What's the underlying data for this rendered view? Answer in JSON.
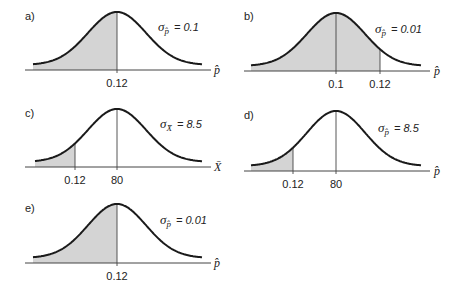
{
  "chart_data": [
    {
      "type": "area",
      "panel": "a)",
      "sigma_symbol": "σ",
      "sigma_subscript": "p̂",
      "sigma_value": "= 0.1",
      "axis_variable": "p̂",
      "mean": 0.12,
      "shade": "left",
      "cutoff": 0.12,
      "tick_labels": [
        "0.12"
      ],
      "layout": {
        "ox": 0,
        "oy": 0,
        "center": 117,
        "cutoff_x": 117,
        "axis_y": 70,
        "peak_y": 12,
        "left": 33,
        "right": 202,
        "axis_left": 25,
        "axis_right": 211,
        "width_sd": 29,
        "sig_x": 158,
        "sig_y": 31,
        "var_x": 214,
        "lab_x": 25,
        "lab_y": 20
      }
    },
    {
      "type": "area",
      "panel": "b)",
      "sigma_symbol": "σ",
      "sigma_subscript": "p̂",
      "sigma_value": "= 0.01",
      "axis_variable": "p̂",
      "mean": 0.1,
      "shade": "left",
      "cutoff": 0.12,
      "tick_labels": [
        "0.1",
        "0.12"
      ],
      "layout": {
        "ox": 0,
        "oy": 0,
        "center": 336,
        "cutoff_x": 380,
        "axis_y": 71,
        "peak_y": 13,
        "left": 251,
        "right": 421,
        "axis_left": 244,
        "axis_right": 430,
        "width_sd": 29,
        "sig_x": 375,
        "sig_y": 33,
        "var_x": 434,
        "lab_x": 244,
        "lab_y": 20
      }
    },
    {
      "type": "area",
      "panel": "c)",
      "sigma_symbol": "σ",
      "sigma_subscript": "X̄",
      "sigma_value": "= 8.5",
      "axis_variable": "X̄",
      "mean": 80,
      "shade": "left",
      "cutoff": 0.12,
      "tick_labels": [
        "0.12",
        "80"
      ],
      "layout": {
        "ox": 0,
        "oy": 0,
        "center": 117,
        "cutoff_x": 75,
        "axis_y": 167,
        "peak_y": 109,
        "left": 35,
        "right": 202,
        "axis_left": 25,
        "axis_right": 211,
        "width_sd": 29,
        "sig_x": 160,
        "sig_y": 128,
        "var_x": 214,
        "lab_x": 25,
        "lab_y": 117
      }
    },
    {
      "type": "area",
      "panel": "d)",
      "sigma_symbol": "σ",
      "sigma_subscript": "p̂",
      "sigma_value": "= 8.5",
      "axis_variable": "p̂",
      "mean": 80,
      "shade": "left",
      "cutoff": 0.12,
      "tick_labels": [
        "0.12",
        "80"
      ],
      "layout": {
        "ox": 0,
        "oy": 0,
        "center": 336,
        "cutoff_x": 293,
        "axis_y": 171,
        "peak_y": 111,
        "left": 251,
        "right": 421,
        "axis_left": 244,
        "axis_right": 430,
        "width_sd": 29,
        "sig_x": 378,
        "sig_y": 132,
        "var_x": 434,
        "lab_x": 244,
        "lab_y": 119
      }
    },
    {
      "type": "area",
      "panel": "e)",
      "sigma_symbol": "σ",
      "sigma_subscript": "p̂",
      "sigma_value": "= 0.01",
      "axis_variable": "p̂",
      "mean": 0.12,
      "shade": "left",
      "cutoff": 0.12,
      "tick_labels": [
        "0.12"
      ],
      "layout": {
        "ox": 0,
        "oy": 0,
        "center": 117,
        "cutoff_x": 117,
        "axis_y": 263,
        "peak_y": 204,
        "left": 33,
        "right": 202,
        "axis_left": 25,
        "axis_right": 211,
        "width_sd": 29,
        "sig_x": 160,
        "sig_y": 224,
        "var_x": 214,
        "lab_x": 25,
        "lab_y": 212
      }
    }
  ],
  "colors": {
    "curve": "#1a1a1a",
    "axis": "#444444",
    "shade": "#d4d4d4",
    "text": "#222222"
  }
}
